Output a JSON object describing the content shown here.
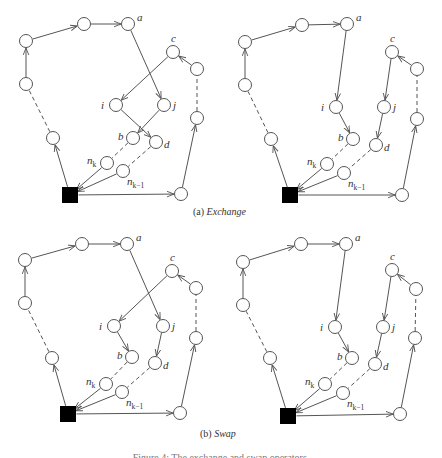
{
  "colors": {
    "edge": "#555555",
    "node_stroke": "#555555",
    "node_fill": "#ffffff",
    "depot": "#000000",
    "label": "#333333"
  },
  "captions": {
    "exchange": {
      "prefix": "(a) ",
      "name": "Exchange",
      "x": 193,
      "y": 206
    },
    "swap": {
      "prefix": "(b) ",
      "name": "Swap",
      "x": 200,
      "y": 428
    },
    "figure": "Figure 4: The exchange and swap operators."
  },
  "panels": [
    {
      "id": "exchange-before",
      "depot": [
        70,
        195
      ],
      "nodes": {
        "p1": [
          26,
          41
        ],
        "p2": [
          84,
          24
        ],
        "a": [
          128,
          24
        ],
        "c": [
          173,
          52
        ],
        "r1": [
          197,
          69
        ],
        "l1": [
          26,
          84
        ],
        "l2": [
          53,
          138
        ],
        "i": [
          116,
          105
        ],
        "j": [
          164,
          105
        ],
        "b": [
          133,
          138
        ],
        "d": [
          156,
          142
        ],
        "r2": [
          197,
          118
        ],
        "nk": [
          107,
          163
        ],
        "nk1": [
          123,
          171
        ],
        "r3": [
          181,
          194
        ]
      },
      "edges": [
        [
          "depot",
          "l2",
          "solid"
        ],
        [
          "l2",
          "l1",
          "dashed"
        ],
        [
          "l1",
          "p1",
          "solid"
        ],
        [
          "p1",
          "p2",
          "solid"
        ],
        [
          "p2",
          "a",
          "solid"
        ],
        [
          "a",
          "j",
          "solid"
        ],
        [
          "j",
          "b",
          "solid"
        ],
        [
          "b",
          "nk",
          "dashed"
        ],
        [
          "nk",
          "depot",
          "solid"
        ],
        [
          "depot",
          "r3",
          "solid"
        ],
        [
          "r3",
          "r2",
          "solid"
        ],
        [
          "r2",
          "r1",
          "dashed"
        ],
        [
          "r1",
          "c",
          "solid"
        ],
        [
          "c",
          "i",
          "solid"
        ],
        [
          "i",
          "d",
          "solid"
        ],
        [
          "d",
          "nk1",
          "dashed"
        ],
        [
          "nk1",
          "depot",
          "solid"
        ]
      ]
    },
    {
      "id": "exchange-after",
      "depot": [
        290,
        195
      ],
      "nodes": {
        "p1": [
          245,
          42
        ],
        "p2": [
          302,
          25
        ],
        "a": [
          347,
          24
        ],
        "c": [
          392,
          52
        ],
        "r1": [
          417,
          69
        ],
        "l1": [
          245,
          85
        ],
        "l2": [
          271,
          139
        ],
        "i": [
          336,
          107
        ],
        "j": [
          384,
          107
        ],
        "b": [
          353,
          139
        ],
        "d": [
          376,
          145
        ],
        "r2": [
          417,
          119
        ],
        "nk": [
          327,
          164
        ],
        "nk1": [
          344,
          173
        ],
        "r3": [
          402,
          195
        ]
      },
      "edges": [
        [
          "depot",
          "l2",
          "solid"
        ],
        [
          "l2",
          "l1",
          "dashed"
        ],
        [
          "l1",
          "p1",
          "solid"
        ],
        [
          "p1",
          "p2",
          "solid"
        ],
        [
          "p2",
          "a",
          "solid"
        ],
        [
          "a",
          "i",
          "solid"
        ],
        [
          "i",
          "b",
          "solid"
        ],
        [
          "b",
          "nk",
          "dashed"
        ],
        [
          "nk",
          "depot",
          "solid"
        ],
        [
          "depot",
          "r3",
          "solid"
        ],
        [
          "r3",
          "r2",
          "solid"
        ],
        [
          "r2",
          "r1",
          "dashed"
        ],
        [
          "r1",
          "c",
          "solid"
        ],
        [
          "c",
          "j",
          "solid"
        ],
        [
          "j",
          "d",
          "solid"
        ],
        [
          "d",
          "nk1",
          "dashed"
        ],
        [
          "nk1",
          "depot",
          "solid"
        ]
      ]
    },
    {
      "id": "swap-before",
      "depot": [
        68,
        414
      ],
      "nodes": {
        "p1": [
          25,
          260
        ],
        "p2": [
          82,
          244
        ],
        "a": [
          127,
          244
        ],
        "c": [
          172,
          271
        ],
        "r1": [
          196,
          288
        ],
        "l1": [
          25,
          303
        ],
        "l2": [
          52,
          358
        ],
        "i": [
          114,
          326
        ],
        "j": [
          163,
          326
        ],
        "b": [
          132,
          357
        ],
        "d": [
          155,
          363
        ],
        "r2": [
          196,
          338
        ],
        "nk": [
          106,
          384
        ],
        "nk1": [
          122,
          392
        ],
        "r3": [
          180,
          413
        ]
      },
      "edges": [
        [
          "depot",
          "l2",
          "solid"
        ],
        [
          "l2",
          "l1",
          "dashed"
        ],
        [
          "l1",
          "p1",
          "solid"
        ],
        [
          "p1",
          "p2",
          "solid"
        ],
        [
          "p2",
          "a",
          "solid"
        ],
        [
          "a",
          "j",
          "solid"
        ],
        [
          "j",
          "d",
          "solid"
        ],
        [
          "d",
          "nk1",
          "dashed"
        ],
        [
          "nk1",
          "depot",
          "solid"
        ],
        [
          "depot",
          "r3",
          "solid"
        ],
        [
          "r3",
          "r2",
          "solid"
        ],
        [
          "r2",
          "r1",
          "dashed"
        ],
        [
          "r1",
          "c",
          "solid"
        ],
        [
          "c",
          "i",
          "solid"
        ],
        [
          "i",
          "b",
          "solid"
        ],
        [
          "b",
          "nk",
          "dashed"
        ],
        [
          "nk",
          "depot",
          "solid"
        ]
      ]
    },
    {
      "id": "swap-after",
      "depot": [
        288,
        416
      ],
      "nodes": {
        "p1": [
          243,
          262
        ],
        "p2": [
          301,
          244
        ],
        "a": [
          346,
          244
        ],
        "c": [
          392,
          270
        ],
        "r1": [
          416,
          289
        ],
        "l1": [
          243,
          305
        ],
        "l2": [
          270,
          358
        ],
        "i": [
          335,
          327
        ],
        "j": [
          383,
          327
        ],
        "b": [
          352,
          358
        ],
        "d": [
          375,
          364
        ],
        "r2": [
          415,
          338
        ],
        "nk": [
          325,
          384
        ],
        "nk1": [
          343,
          393
        ],
        "r3": [
          400,
          414
        ]
      },
      "edges": [
        [
          "depot",
          "l2",
          "solid"
        ],
        [
          "l2",
          "l1",
          "dashed"
        ],
        [
          "l1",
          "p1",
          "solid"
        ],
        [
          "p1",
          "p2",
          "solid"
        ],
        [
          "p2",
          "a",
          "solid"
        ],
        [
          "a",
          "i",
          "solid"
        ],
        [
          "i",
          "b",
          "solid"
        ],
        [
          "b",
          "nk",
          "dashed"
        ],
        [
          "nk",
          "depot",
          "solid"
        ],
        [
          "depot",
          "r3",
          "solid"
        ],
        [
          "r3",
          "r2",
          "solid"
        ],
        [
          "r2",
          "r1",
          "dashed"
        ],
        [
          "r1",
          "c",
          "solid"
        ],
        [
          "c",
          "j",
          "solid"
        ],
        [
          "j",
          "d",
          "solid"
        ],
        [
          "d",
          "nk1",
          "dashed"
        ],
        [
          "nk1",
          "depot",
          "solid"
        ]
      ]
    }
  ],
  "labels": {
    "a": {
      "text": "a",
      "dx": 9,
      "dy": -3
    },
    "c": {
      "text": "c",
      "dx": -2,
      "dy": -10
    },
    "i": {
      "text": "i",
      "dx": -15,
      "dy": 4
    },
    "j": {
      "text": "j",
      "dx": 9,
      "dy": 4
    },
    "b": {
      "text": "b",
      "dx": -15,
      "dy": 2
    },
    "d": {
      "text": "d",
      "dx": 8,
      "dy": 6
    },
    "nk": {
      "text": "n",
      "sub": "k",
      "dx": -20,
      "dy": 1
    },
    "nk1": {
      "text": "n",
      "sub": "k−1",
      "dx": 4,
      "dy": 14
    }
  }
}
